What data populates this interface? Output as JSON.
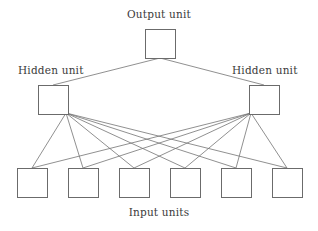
{
  "figure": {
    "title_text": "",
    "type": "neural-network-diagram",
    "background_color": "#ffffff",
    "line_color": "#737373",
    "box_stroke_color": "#6b6b6b",
    "box_fill_color": "#ffffff",
    "text_color": "#3a3a3a"
  },
  "labels": {
    "output": "Output unit",
    "hidden_left": "Hidden unit",
    "hidden_right": "Hidden unit",
    "input": "Input units"
  },
  "chart_data": {
    "type": "diagram",
    "title": "",
    "layers": [
      {
        "name": "output",
        "label": "Output unit",
        "count": 1,
        "nodes": [
          {
            "id": "o1",
            "x": 145,
            "y": 29,
            "w": 30,
            "h": 29
          }
        ]
      },
      {
        "name": "hidden",
        "label": "Hidden unit",
        "count": 2,
        "nodes": [
          {
            "id": "h1",
            "x": 38,
            "y": 85,
            "w": 30,
            "h": 29
          },
          {
            "id": "h2",
            "x": 249,
            "y": 85,
            "w": 30,
            "h": 29
          }
        ]
      },
      {
        "name": "input",
        "label": "Input units",
        "count": 6,
        "nodes": [
          {
            "id": "i1",
            "x": 17,
            "y": 168,
            "w": 30,
            "h": 29
          },
          {
            "id": "i2",
            "x": 68,
            "y": 168,
            "w": 30,
            "h": 29
          },
          {
            "id": "i3",
            "x": 119,
            "y": 168,
            "w": 30,
            "h": 29
          },
          {
            "id": "i4",
            "x": 170,
            "y": 168,
            "w": 30,
            "h": 29
          },
          {
            "id": "i5",
            "x": 221,
            "y": 168,
            "w": 30,
            "h": 29
          },
          {
            "id": "i6",
            "x": 272,
            "y": 168,
            "w": 30,
            "h": 29
          }
        ]
      }
    ],
    "edges": [
      {
        "from": "h1",
        "to": "o1",
        "x1": 53,
        "y1": 85,
        "x2": 160,
        "y2": 58
      },
      {
        "from": "h2",
        "to": "o1",
        "x1": 264,
        "y1": 85,
        "x2": 160,
        "y2": 58
      },
      {
        "from": "h1",
        "to": "i1",
        "x1": 66,
        "y1": 113,
        "x2": 32,
        "y2": 168
      },
      {
        "from": "h1",
        "to": "i2",
        "x1": 66,
        "y1": 113,
        "x2": 83,
        "y2": 168
      },
      {
        "from": "h1",
        "to": "i3",
        "x1": 66,
        "y1": 113,
        "x2": 134,
        "y2": 168
      },
      {
        "from": "h1",
        "to": "i4",
        "x1": 66,
        "y1": 113,
        "x2": 185,
        "y2": 168
      },
      {
        "from": "h1",
        "to": "i5",
        "x1": 66,
        "y1": 113,
        "x2": 236,
        "y2": 168
      },
      {
        "from": "h1",
        "to": "i6",
        "x1": 66,
        "y1": 113,
        "x2": 287,
        "y2": 168
      },
      {
        "from": "h2",
        "to": "i1",
        "x1": 251,
        "y1": 113,
        "x2": 32,
        "y2": 168
      },
      {
        "from": "h2",
        "to": "i2",
        "x1": 251,
        "y1": 113,
        "x2": 83,
        "y2": 168
      },
      {
        "from": "h2",
        "to": "i3",
        "x1": 251,
        "y1": 113,
        "x2": 134,
        "y2": 168
      },
      {
        "from": "h2",
        "to": "i4",
        "x1": 251,
        "y1": 113,
        "x2": 185,
        "y2": 168
      },
      {
        "from": "h2",
        "to": "i5",
        "x1": 251,
        "y1": 113,
        "x2": 236,
        "y2": 168
      },
      {
        "from": "h2",
        "to": "i6",
        "x1": 251,
        "y1": 113,
        "x2": 287,
        "y2": 168
      }
    ],
    "annotations": [
      {
        "text": "Output unit",
        "x": 159,
        "y": 16
      },
      {
        "text": "Hidden unit",
        "x": 57,
        "y": 72
      },
      {
        "text": "Hidden unit",
        "x": 270,
        "y": 72
      },
      {
        "text": "Input units",
        "x": 159,
        "y": 214
      }
    ]
  }
}
